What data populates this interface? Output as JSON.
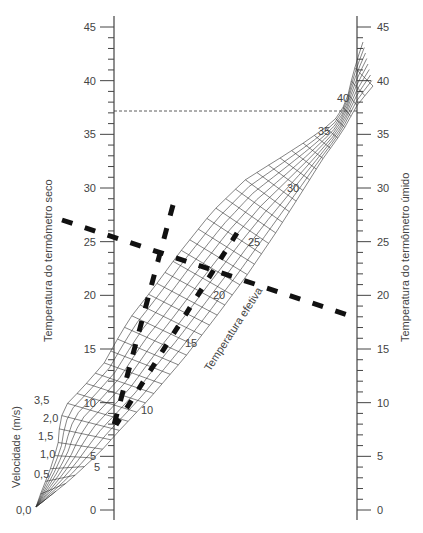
{
  "chart_data": {
    "type": "nomogram",
    "title": "",
    "left_axis": {
      "label": "Temperatura do termômetro seco",
      "ticks": [
        0,
        5,
        10,
        15,
        20,
        25,
        30,
        35,
        40,
        45
      ],
      "range": [
        0,
        45
      ],
      "minor_step": 1
    },
    "right_axis": {
      "label": "Temperatura do termômetro úmido",
      "ticks": [
        0,
        5,
        10,
        15,
        20,
        25,
        30,
        35,
        40,
        45
      ],
      "range": [
        0,
        45
      ],
      "minor_step": 1
    },
    "effective_temperature": {
      "label": "Temperatura efetiva",
      "ticks": [
        5,
        10,
        15,
        20,
        25,
        30,
        35,
        40
      ]
    },
    "velocity": {
      "label": "Velocidade (m/s)",
      "ticks": [
        "0,0",
        "0,5",
        "1,0",
        "1,5",
        "2,0",
        "3,5"
      ]
    },
    "reference_line": {
      "value": 37.2,
      "style": "dashed thin"
    },
    "example_lines": [
      {
        "name": "dry-to-wet-bulb",
        "from_left_dry": 25.5,
        "to_right_wet": 18,
        "style": "thick dashed"
      },
      {
        "name": "effective-temp-reading",
        "style": "thick dashed",
        "approx_effective": 21
      }
    ]
  },
  "labels": {
    "left_axis_title": "Temperatura do termômetro seco",
    "right_axis_title": "Temperatura do termômetro úmido",
    "effective_title": "Temperatura efetiva",
    "velocity_title": "Velocidade (m/s)",
    "left_ticks": [
      "0",
      "5",
      "10",
      "15",
      "20",
      "25",
      "30",
      "35",
      "40",
      "45"
    ],
    "right_ticks": [
      "0",
      "5",
      "10",
      "15",
      "20",
      "25",
      "30",
      "35",
      "40",
      "45"
    ],
    "effective_ticks": [
      "5",
      "10",
      "15",
      "20",
      "25",
      "30",
      "35",
      "40"
    ],
    "velocity_ticks": [
      "0,0",
      "0,5",
      "1,0",
      "1,5",
      "2,0",
      "3,5"
    ]
  }
}
